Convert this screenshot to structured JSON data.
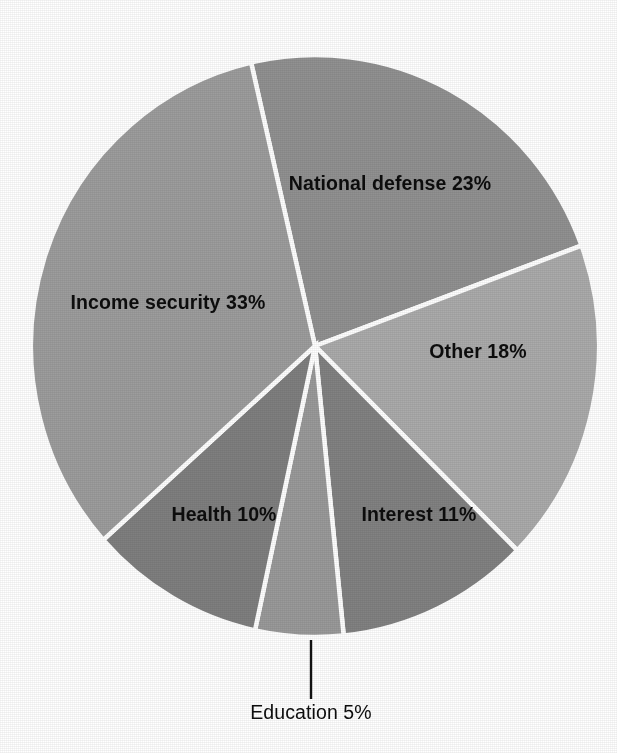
{
  "chart_data": {
    "type": "pie",
    "title": "",
    "subtitle": "",
    "xlabel": "",
    "ylabel": "",
    "legend_position": "none",
    "grid": false,
    "labels_inside_slices": true,
    "total_percent": 100,
    "categories": [
      "National defense",
      "Other",
      "Interest",
      "Education",
      "Health",
      "Income security"
    ],
    "values": [
      23,
      18,
      11,
      5,
      10,
      33
    ],
    "slices": [
      {
        "name": "National defense",
        "value": 23,
        "label": "National defense 23%",
        "color": "#919191",
        "start_angle_deg": -13,
        "end_angle_deg": 69.8,
        "label_x": 390,
        "label_y": 190,
        "label_anchor": "middle",
        "callout": false
      },
      {
        "name": "Other",
        "value": 18,
        "label": "Other 18%",
        "color": "#ababab",
        "start_angle_deg": 69.8,
        "end_angle_deg": 134.6,
        "label_x": 478,
        "label_y": 358,
        "label_anchor": "middle",
        "callout": false
      },
      {
        "name": "Interest",
        "value": 11,
        "label": "Interest 11%",
        "color": "#828282",
        "start_angle_deg": 134.6,
        "end_angle_deg": 174.2,
        "label_x": 419,
        "label_y": 521,
        "label_anchor": "middle",
        "callout": false
      },
      {
        "name": "Education",
        "value": 5,
        "label": "Education 5%",
        "color": "#9a9a9a",
        "start_angle_deg": 174.2,
        "end_angle_deg": 192.2,
        "label_x": 311,
        "label_y": 719,
        "label_anchor": "middle",
        "callout": true,
        "leader_x": 311,
        "leader_y1": 640,
        "leader_y2": 699
      },
      {
        "name": "Health",
        "value": 10,
        "label": "Health 10%",
        "color": "#7f7f7f",
        "start_angle_deg": 192.2,
        "end_angle_deg": 228.2,
        "label_x": 224,
        "label_y": 521,
        "label_anchor": "middle",
        "callout": false
      },
      {
        "name": "Income security",
        "value": 33,
        "label": "Income security 33%",
        "color": "#9d9d9d",
        "start_angle_deg": 228.2,
        "end_angle_deg": 347,
        "label_x": 168,
        "label_y": 309,
        "label_anchor": "middle",
        "callout": false
      }
    ],
    "geometry": {
      "center_x": 315,
      "center_y": 346,
      "radius_x": 284,
      "radius_y": 291
    },
    "style": {
      "background": "#ffffff",
      "slice_border_color": "#ffffff",
      "label_color": "#0d0d0d",
      "leader_line_color": "#111111"
    }
  }
}
